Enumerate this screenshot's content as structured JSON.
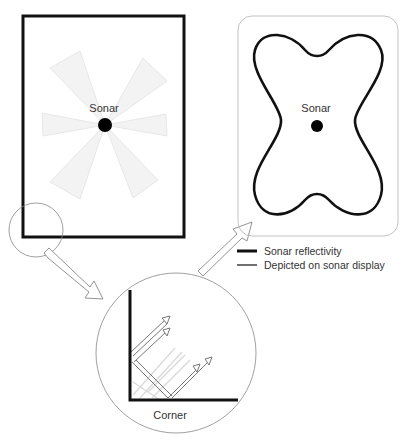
{
  "left_room": {
    "label": "Sonar"
  },
  "right_display": {
    "label": "Sonar"
  },
  "zoom_detail": {
    "label": "Corner"
  },
  "legend": {
    "items": [
      {
        "label": "Sonar reflectivity",
        "style": "thick"
      },
      {
        "label": "Depicted on sonar display",
        "style": "thin"
      }
    ]
  },
  "colors": {
    "wall": "#111111",
    "beam": "#e6e6e6",
    "outline": "#888888",
    "panel": "#bbbbbb"
  }
}
